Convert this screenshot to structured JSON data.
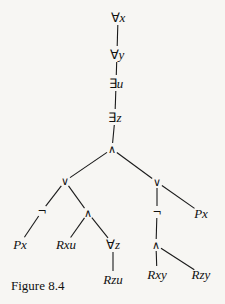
{
  "diagram": {
    "type": "formula-parse-tree",
    "caption": "Figure 8.4",
    "nodes": [
      {
        "id": "n1",
        "label": "∀x",
        "kind": "quant",
        "sym": "∀",
        "var": "x",
        "x": 118,
        "y": 17
      },
      {
        "id": "n2",
        "label": "∀y",
        "kind": "quant",
        "sym": "∀",
        "var": "y",
        "x": 117,
        "y": 54
      },
      {
        "id": "n3",
        "label": "∃u",
        "kind": "quant",
        "sym": "∃",
        "var": "u",
        "x": 116,
        "y": 83
      },
      {
        "id": "n4",
        "label": "∃z",
        "kind": "quant",
        "sym": "∃",
        "var": "z",
        "x": 115,
        "y": 117
      },
      {
        "id": "n5",
        "label": "∧",
        "kind": "op",
        "x": 112,
        "y": 149
      },
      {
        "id": "n6",
        "label": "∨",
        "kind": "op",
        "x": 65,
        "y": 181
      },
      {
        "id": "n7",
        "label": "∨",
        "kind": "op",
        "x": 157,
        "y": 182
      },
      {
        "id": "n8",
        "label": "¬",
        "kind": "op",
        "x": 42,
        "y": 211
      },
      {
        "id": "n9",
        "label": "∧",
        "kind": "op",
        "x": 88,
        "y": 213
      },
      {
        "id": "n10",
        "label": "¬",
        "kind": "op",
        "x": 157,
        "y": 212
      },
      {
        "id": "n11",
        "label": "Px",
        "kind": "atom",
        "x": 201,
        "y": 213
      },
      {
        "id": "n12",
        "label": "Px",
        "kind": "atom",
        "x": 20,
        "y": 244
      },
      {
        "id": "n13",
        "label": "Rxu",
        "kind": "atom",
        "x": 66,
        "y": 244
      },
      {
        "id": "n14",
        "label": "∀z",
        "kind": "quant",
        "sym": "∀",
        "var": "z",
        "x": 113,
        "y": 244
      },
      {
        "id": "n15",
        "label": "∧",
        "kind": "op",
        "x": 156,
        "y": 245
      },
      {
        "id": "n16",
        "label": "Rzu",
        "kind": "atom",
        "x": 113,
        "y": 279
      },
      {
        "id": "n17",
        "label": "Rxy",
        "kind": "atom",
        "x": 157,
        "y": 274
      },
      {
        "id": "n18",
        "label": "Rzy",
        "kind": "atom",
        "x": 201,
        "y": 274
      }
    ],
    "edges": [
      {
        "from": "n1",
        "to": "n2"
      },
      {
        "from": "n2",
        "to": "n3"
      },
      {
        "from": "n3",
        "to": "n4"
      },
      {
        "from": "n4",
        "to": "n5"
      },
      {
        "from": "n5",
        "to": "n6"
      },
      {
        "from": "n5",
        "to": "n7"
      },
      {
        "from": "n6",
        "to": "n8"
      },
      {
        "from": "n6",
        "to": "n9"
      },
      {
        "from": "n7",
        "to": "n10"
      },
      {
        "from": "n7",
        "to": "n11"
      },
      {
        "from": "n8",
        "to": "n12"
      },
      {
        "from": "n9",
        "to": "n13"
      },
      {
        "from": "n9",
        "to": "n14"
      },
      {
        "from": "n14",
        "to": "n16"
      },
      {
        "from": "n10",
        "to": "n15"
      },
      {
        "from": "n15",
        "to": "n17"
      },
      {
        "from": "n15",
        "to": "n18"
      }
    ],
    "colors": {
      "ink": "#111111",
      "paper": "#f7f6f3"
    }
  }
}
